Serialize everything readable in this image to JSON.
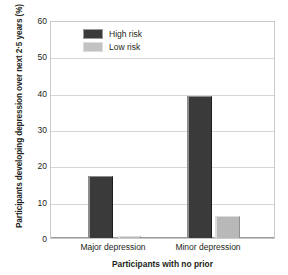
{
  "chart_data": {
    "type": "bar",
    "title": "",
    "xlabel": "Participants with no prior",
    "ylabel": "Participants developing depression over next 2·5 years (%)",
    "categories": [
      "Major depression",
      "Minor depression"
    ],
    "series": [
      {
        "name": "High risk",
        "values": [
          17,
          39
        ],
        "color": "#3a3a3a"
      },
      {
        "name": "Low risk",
        "values": [
          0.5,
          6
        ],
        "color": "#b8b8b8"
      }
    ],
    "ylim": [
      0,
      60
    ],
    "yticks": [
      0,
      10,
      20,
      30,
      40,
      50,
      60
    ],
    "ytick_labels": [
      "0",
      "10",
      "20",
      "30",
      "40",
      "50",
      "60"
    ],
    "grid": true,
    "legend_position": "top-left-inside"
  },
  "legend": {
    "items": [
      {
        "label": "High risk"
      },
      {
        "label": "Low risk"
      }
    ]
  },
  "axes": {
    "y_title": "Participants developing depression over next 2·5 years (%)",
    "x_title": "Participants with no prior",
    "y_tick_labels": [
      "60",
      "50",
      "40",
      "30",
      "20",
      "10",
      "0"
    ],
    "x_tick_labels": [
      "Major depression",
      "Minor depression"
    ]
  }
}
